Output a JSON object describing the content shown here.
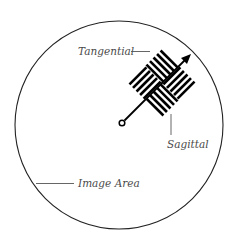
{
  "diagram": {
    "type": "lens-test-target-illustration",
    "labels": {
      "tangential": "Tangential",
      "sagittal": "Sagittal",
      "image_area": "Image Area"
    },
    "colors": {
      "background": "#ffffff",
      "stroke": "#000000",
      "label_text": "#4a4a4a",
      "leader_line": "#555555"
    },
    "image_circle": {
      "cx": 119,
      "cy": 125,
      "r": 104
    },
    "radial_arrow": {
      "from": [
        122,
        123
      ],
      "to": [
        190,
        54
      ]
    },
    "pattern": {
      "center": [
        162,
        83
      ],
      "half_size": 24,
      "lines_per_quadrant": 5,
      "rotation_deg": -45
    }
  }
}
